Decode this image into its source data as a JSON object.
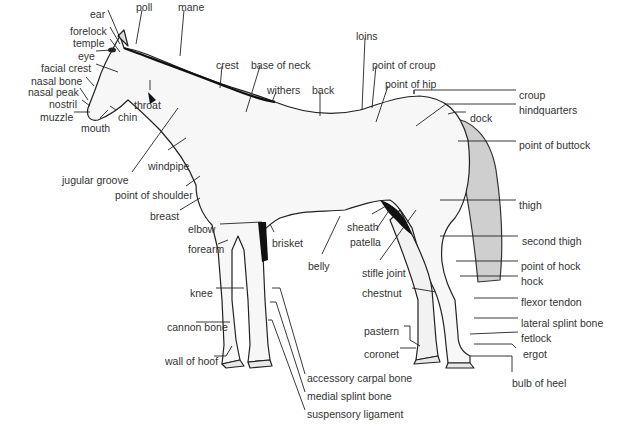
{
  "diagram": {
    "colors": {
      "ink": "#1a1a1a",
      "label": "#333333",
      "background": "#ffffff"
    },
    "labels": [
      {
        "id": "ear",
        "text": "ear",
        "x": 90,
        "y": 4
      },
      {
        "id": "poll",
        "text": "poll",
        "x": 136,
        "y": -3
      },
      {
        "id": "mane",
        "text": "mane",
        "x": 178,
        "y": -3
      },
      {
        "id": "forelock",
        "text": "forelock",
        "x": 70,
        "y": 21
      },
      {
        "id": "temple",
        "text": "temple",
        "x": 73,
        "y": 33
      },
      {
        "id": "eye",
        "text": "eye",
        "x": 78,
        "y": 46
      },
      {
        "id": "facial_crest",
        "text": "facial crest",
        "x": 41,
        "y": 58
      },
      {
        "id": "nasal_bone",
        "text": "nasal bone",
        "x": 31,
        "y": 71
      },
      {
        "id": "nasal_peak",
        "text": "nasal peak",
        "x": 28,
        "y": 82
      },
      {
        "id": "nostril",
        "text": "nostril",
        "x": 49,
        "y": 94
      },
      {
        "id": "muzzle",
        "text": "muzzle",
        "x": 40,
        "y": 107
      },
      {
        "id": "throat",
        "text": "throat",
        "x": 134,
        "y": 95
      },
      {
        "id": "chin",
        "text": "chin",
        "x": 118,
        "y": 107
      },
      {
        "id": "mouth",
        "text": "mouth",
        "x": 81,
        "y": 118
      },
      {
        "id": "crest",
        "text": "crest",
        "x": 216,
        "y": 55
      },
      {
        "id": "base_of_neck",
        "text": "base of neck",
        "x": 251,
        "y": 55
      },
      {
        "id": "withers",
        "text": "withers",
        "x": 267,
        "y": 80
      },
      {
        "id": "back",
        "text": "back",
        "x": 312,
        "y": 80
      },
      {
        "id": "loins",
        "text": "loins",
        "x": 356,
        "y": 26
      },
      {
        "id": "point_of_croup",
        "text": "point of croup",
        "x": 372,
        "y": 55
      },
      {
        "id": "point_of_hip",
        "text": "point of hip",
        "x": 385,
        "y": 74
      },
      {
        "id": "croup",
        "text": "croup",
        "x": 519,
        "y": 85
      },
      {
        "id": "hindquarters",
        "text": "hindquarters",
        "x": 519,
        "y": 100
      },
      {
        "id": "dock",
        "text": "dock",
        "x": 470,
        "y": 108
      },
      {
        "id": "point_of_buttock",
        "text": "point of buttock",
        "x": 519,
        "y": 135
      },
      {
        "id": "windpipe",
        "text": "windpipe",
        "x": 148,
        "y": 156
      },
      {
        "id": "jugular_groove",
        "text": "jugular groove",
        "x": 62,
        "y": 170
      },
      {
        "id": "point_of_shoulder",
        "text": "point of shoulder",
        "x": 115,
        "y": 185
      },
      {
        "id": "breast",
        "text": "breast",
        "x": 150,
        "y": 206
      },
      {
        "id": "thigh",
        "text": "thigh",
        "x": 519,
        "y": 195
      },
      {
        "id": "sheath",
        "text": "sheath",
        "x": 347,
        "y": 217
      },
      {
        "id": "elbow",
        "text": "elbow",
        "x": 188,
        "y": 219
      },
      {
        "id": "patella",
        "text": "patella",
        "x": 350,
        "y": 232
      },
      {
        "id": "forearm",
        "text": "forearm",
        "x": 188,
        "y": 239
      },
      {
        "id": "brisket",
        "text": "brisket",
        "x": 272,
        "y": 233
      },
      {
        "id": "second_thigh",
        "text": "second thigh",
        "x": 522,
        "y": 231
      },
      {
        "id": "belly",
        "text": "belly",
        "x": 308,
        "y": 256
      },
      {
        "id": "point_of_hock",
        "text": "point of hock",
        "x": 521,
        "y": 256
      },
      {
        "id": "stifle_joint",
        "text": "stifle joint",
        "x": 362,
        "y": 263
      },
      {
        "id": "hock",
        "text": "hock",
        "x": 521,
        "y": 271
      },
      {
        "id": "knee",
        "text": "knee",
        "x": 190,
        "y": 283
      },
      {
        "id": "chestnut",
        "text": "chestnut",
        "x": 362,
        "y": 283
      },
      {
        "id": "flexor_tendon",
        "text": "flexor tendon",
        "x": 521,
        "y": 292
      },
      {
        "id": "cannon_bone",
        "text": "cannon bone",
        "x": 167,
        "y": 317
      },
      {
        "id": "lateral_splint_bone",
        "text": "lateral splint bone",
        "x": 521,
        "y": 313
      },
      {
        "id": "pastern",
        "text": "pastern",
        "x": 364,
        "y": 321
      },
      {
        "id": "fetlock",
        "text": "fetlock",
        "x": 521,
        "y": 328
      },
      {
        "id": "coronet",
        "text": "coronet",
        "x": 364,
        "y": 344
      },
      {
        "id": "ergot",
        "text": "ergot",
        "x": 523,
        "y": 344
      },
      {
        "id": "wall_of_hoof",
        "text": "wall of hoof",
        "x": 165,
        "y": 351
      },
      {
        "id": "bulb_of_heel",
        "text": "bulb of heel",
        "x": 512,
        "y": 373
      },
      {
        "id": "accessory_carpal_bone",
        "text": "accessory carpal bone",
        "x": 307,
        "y": 368
      },
      {
        "id": "medial_splint_bone",
        "text": "medial splint bone",
        "x": 307,
        "y": 386
      },
      {
        "id": "suspensory_ligament",
        "text": "suspensory ligament",
        "x": 307,
        "y": 404
      }
    ]
  }
}
